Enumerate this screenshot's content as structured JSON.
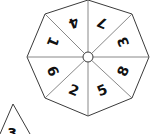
{
  "spinner": {
    "shape": "octagon",
    "center": [
      88,
      57
    ],
    "hub_radius": 5,
    "vertices": [
      [
        88,
        0
      ],
      [
        132,
        14
      ],
      [
        149,
        57
      ],
      [
        132,
        98
      ],
      [
        88,
        116
      ],
      [
        45,
        98
      ],
      [
        27,
        57
      ],
      [
        45,
        14
      ]
    ],
    "segments": [
      {
        "label": "7",
        "x": 102,
        "y": 23,
        "rotate": 202.5
      },
      {
        "label": "3",
        "x": 123,
        "y": 42,
        "rotate": 247.5
      },
      {
        "label": "8",
        "x": 123,
        "y": 71,
        "rotate": 292.5
      },
      {
        "label": "5",
        "x": 102,
        "y": 90,
        "rotate": 337.5
      },
      {
        "label": "2",
        "x": 74,
        "y": 90,
        "rotate": 22.5
      },
      {
        "label": "6",
        "x": 53,
        "y": 71,
        "rotate": 67.5
      },
      {
        "label": "1",
        "x": 53,
        "y": 42,
        "rotate": 112.5
      },
      {
        "label": "4",
        "x": 74,
        "y": 23,
        "rotate": 157.5
      }
    ],
    "colors": {
      "line": "#3a3a3a",
      "text": "#111111",
      "fill": "#ffffff"
    }
  },
  "partial_triangle": {
    "apex": [
      13,
      104
    ],
    "left": [
      0,
      134
    ],
    "right": [
      30,
      134
    ],
    "label": "3",
    "label_pos": [
      12,
      138
    ]
  }
}
